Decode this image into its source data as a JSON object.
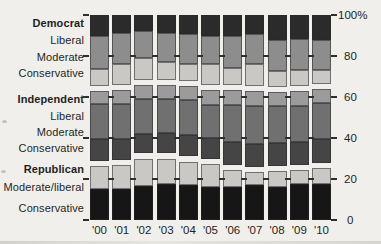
{
  "figure": {
    "background_color": "#f0efeb",
    "text_color": "#1f1f1f",
    "tick_color": "#2e2e2e"
  },
  "chart_data": {
    "type": "bar",
    "stacked": true,
    "orientation": "vertical",
    "unit": "percent of adults",
    "categories": [
      "'00",
      "'01",
      "'02",
      "'03",
      "'04",
      "'05",
      "'06",
      "'07",
      "'08",
      "'09",
      "'10"
    ],
    "group_gap_percent": 2.5,
    "grid": "stub-dashes-at-20pct-steps",
    "legend_position": "left-row-labels",
    "y_axis": {
      "side": "right",
      "ylim": [
        0,
        100
      ],
      "ticks": [
        {
          "label": "100%",
          "value": 100
        },
        {
          "label": "80",
          "value": 80
        },
        {
          "label": "60",
          "value": 60
        },
        {
          "label": "40",
          "value": 40
        },
        {
          "label": "20",
          "value": 20
        },
        {
          "label": "0",
          "value": 0
        }
      ]
    },
    "groups": [
      {
        "label": "Democrat",
        "segments": [
          {
            "label": "Liberal",
            "color": "#2b2b2b",
            "values": [
              10.0,
              9.0,
              8.0,
              9.0,
              9.5,
              10.0,
              10.0,
              9.5,
              12.0,
              11.5,
              12.0
            ]
          },
          {
            "label": "Moderate",
            "color": "#8d8d8d",
            "values": [
              16.5,
              15.0,
              13.0,
              14.0,
              14.5,
              14.0,
              16.0,
              14.5,
              15.5,
              15.5,
              15.0
            ]
          },
          {
            "label": "Conservative",
            "color": "#c9c8c4",
            "values": [
              8.0,
              10.0,
              10.5,
              8.5,
              8.0,
              10.0,
              8.0,
              10.5,
              7.5,
              7.5,
              6.5
            ]
          }
        ]
      },
      {
        "label": "Independent",
        "segments": [
          {
            "label": "Liberal",
            "color": "#9b9b9b",
            "values": [
              6.5,
              7.0,
              7.0,
              7.0,
              7.0,
              7.5,
              7.5,
              7.5,
              7.0,
              7.5,
              7.0
            ]
          },
          {
            "label": "Moderate",
            "color": "#707070",
            "values": [
              17.0,
              17.0,
              17.0,
              16.5,
              17.0,
              16.0,
              18.0,
              18.5,
              18.0,
              17.5,
              17.5
            ]
          },
          {
            "label": "Conservative",
            "color": "#454545",
            "values": [
              10.5,
              10.0,
              9.5,
              10.0,
              10.5,
              10.0,
              11.0,
              11.0,
              11.0,
              11.0,
              11.5
            ]
          }
        ]
      },
      {
        "label": "Republican",
        "segments": [
          {
            "label": "Moderate/liberal",
            "color": "#c9c8c4",
            "values": [
              11.5,
              12.0,
              13.5,
              12.5,
              11.5,
              11.5,
              8.5,
              6.5,
              8.0,
              7.0,
              8.0
            ]
          },
          {
            "label": "Conservative",
            "color": "#161616",
            "values": [
              15.0,
              15.0,
              16.5,
              17.5,
              17.0,
              16.0,
              16.0,
              17.0,
              16.0,
              17.5,
              17.5
            ]
          }
        ]
      }
    ]
  }
}
